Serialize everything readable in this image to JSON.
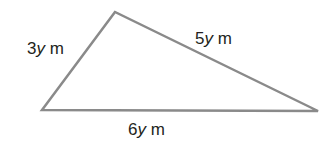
{
  "diagram": {
    "type": "triangle",
    "stroke_color": "#8a8a8a",
    "text_color": "#231f20",
    "vertices": {
      "top": [
        115,
        12
      ],
      "left": [
        42,
        110
      ],
      "right": [
        318,
        111
      ]
    },
    "sides": {
      "left": {
        "coef": "3",
        "var": "y",
        "unit": " m"
      },
      "right": {
        "coef": "5",
        "var": "y",
        "unit": " m"
      },
      "bottom": {
        "coef": "6",
        "var": "y",
        "unit": " m"
      }
    }
  }
}
